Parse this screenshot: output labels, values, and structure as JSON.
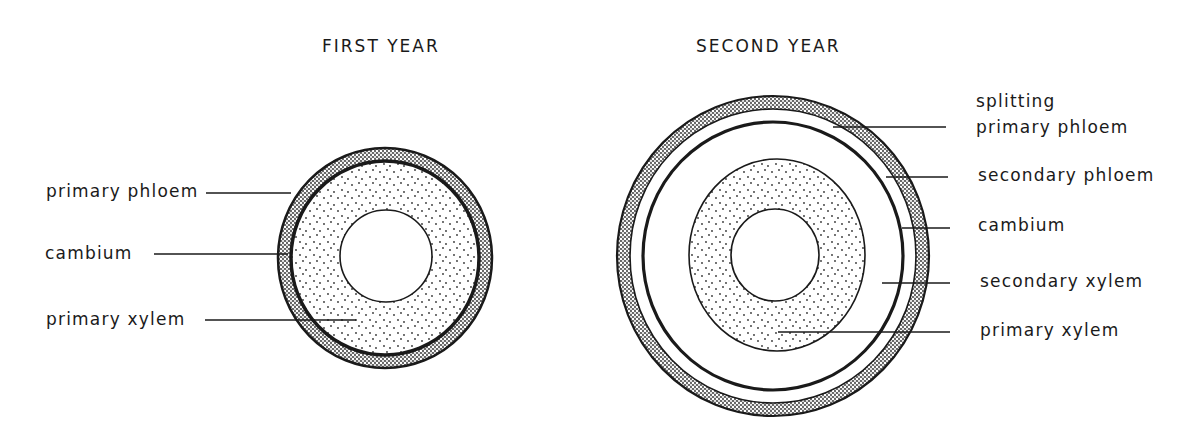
{
  "panels": [
    {
      "id": "first-year",
      "title": "FIRST YEAR",
      "labels": [
        {
          "text": "primary phloem"
        },
        {
          "text": "cambium"
        },
        {
          "text": "primary xylem"
        }
      ]
    },
    {
      "id": "second-year",
      "title": "SECOND YEAR",
      "labels": [
        {
          "text": "splitting"
        },
        {
          "text": "primary phloem"
        },
        {
          "text": "secondary phloem"
        },
        {
          "text": "cambium"
        },
        {
          "text": "secondary xylem"
        },
        {
          "text": "primary xylem"
        }
      ]
    }
  ],
  "colors": {
    "ink": "#1a1a1a",
    "background": "#ffffff"
  }
}
